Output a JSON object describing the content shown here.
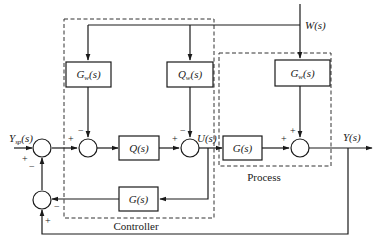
{
  "diagram": {
    "type": "control-block-diagram",
    "signals": {
      "setpoint": "Ysp(s)",
      "setpoint_main": "Y",
      "setpoint_sub": "sp",
      "setpoint_tail": "(s)",
      "disturbance": "W(s)",
      "control": "U(s)",
      "output": "Y(s)"
    },
    "blocks": {
      "controller_gw": {
        "main": "G",
        "sub": "w",
        "tail": "(s)"
      },
      "controller_qw": {
        "main": "Q",
        "sub": "w",
        "tail": "(s)"
      },
      "controller_q": {
        "label": "Q(s)"
      },
      "controller_model_g": {
        "label": "G(s)"
      },
      "process_g": {
        "label": "G(s)"
      },
      "process_gw": {
        "main": "G",
        "sub": "w",
        "tail": "(s)"
      }
    },
    "groups": {
      "controller": "Controller",
      "process": "Process"
    },
    "signs": {
      "j1_setpoint": "+",
      "j1_feedback": "−",
      "j2_main": "+",
      "j2_gw": "−",
      "j3_main": "+",
      "j3_qw": "−",
      "jp_main": "+",
      "jp_gw": "+",
      "jf_model": "−",
      "jf_output": "+"
    }
  }
}
